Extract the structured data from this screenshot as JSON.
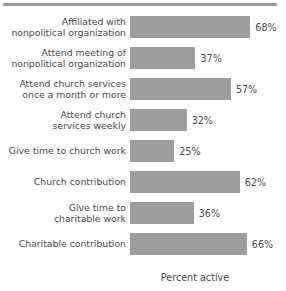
{
  "chart_data": {
    "type": "bar",
    "orientation": "horizontal",
    "title": "",
    "xlabel": "Percent active",
    "ylabel": "",
    "xlim": [
      0,
      75
    ],
    "grid": false,
    "legend": false,
    "value_suffix": "%",
    "bar_color": "#9d9d9d",
    "categories": [
      "Affiliated with\nnonpolitical organization",
      "Attend meeting of\nnonpolitical organization",
      "Attend church services\nonce a month or more",
      "Attend church\nservices weekly",
      "Give time to church work",
      "Church contribution",
      "Give time to\ncharitable work",
      "Charitable contribution"
    ],
    "values": [
      68,
      37,
      57,
      32,
      25,
      62,
      36,
      66
    ],
    "value_labels": [
      "68%",
      "37%",
      "57%",
      "32%",
      "25%",
      "62%",
      "36%",
      "66%"
    ]
  }
}
